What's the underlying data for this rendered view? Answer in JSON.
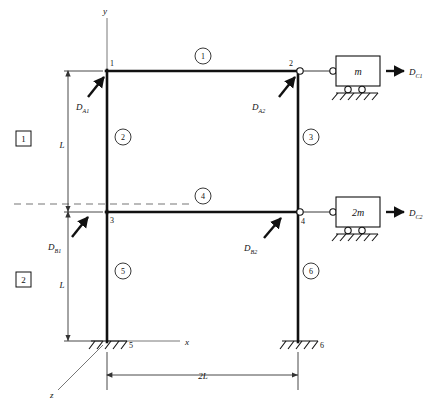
{
  "figure": {
    "axes": {
      "y_label": "y",
      "x_label": "x",
      "z_label": "z"
    },
    "nodes": [
      {
        "id": "1",
        "label": "1",
        "x": 107,
        "y": 71
      },
      {
        "id": "2",
        "label": "2",
        "x": 298,
        "y": 71
      },
      {
        "id": "3",
        "label": "3",
        "x": 107,
        "y": 212
      },
      {
        "id": "4",
        "label": "4",
        "x": 298,
        "y": 212
      },
      {
        "id": "5",
        "label": "5",
        "x": 107,
        "y": 341
      },
      {
        "id": "6",
        "label": "6",
        "x": 298,
        "y": 341
      }
    ],
    "elements": [
      {
        "id": "1",
        "label": "1",
        "cx": 203,
        "cy": 59,
        "type": "beam"
      },
      {
        "id": "2",
        "label": "2",
        "cx": 123,
        "cy": 140,
        "type": "column"
      },
      {
        "id": "3",
        "label": "3",
        "cx": 311,
        "cy": 140,
        "type": "column"
      },
      {
        "id": "4",
        "label": "4",
        "cx": 203,
        "cy": 199,
        "type": "beam"
      },
      {
        "id": "5",
        "label": "5",
        "cx": 123,
        "cy": 274,
        "type": "column"
      },
      {
        "id": "6",
        "label": "6",
        "cx": 311,
        "cy": 274,
        "type": "column"
      }
    ],
    "stories": [
      {
        "label": "1",
        "dimension": "L"
      },
      {
        "label": "2",
        "dimension": "L"
      }
    ],
    "span": {
      "label": "2L"
    },
    "masses": [
      {
        "label": "m",
        "force_base": "D",
        "force_sub": "C1",
        "level": "upper"
      },
      {
        "label": "2m",
        "force_base": "D",
        "force_sub": "C2",
        "level": "lower"
      }
    ],
    "applied_forces": [
      {
        "base": "D",
        "sub": "A1",
        "node": "1",
        "lx": 78,
        "ly": 108
      },
      {
        "base": "D",
        "sub": "A2",
        "node": "2",
        "lx": 254,
        "ly": 108
      },
      {
        "base": "D",
        "sub": "B1",
        "node": "3",
        "lx": 47,
        "ly": 242
      },
      {
        "base": "D",
        "sub": "B2",
        "node": "4",
        "lx": 246,
        "ly": 243
      }
    ],
    "supports": [
      {
        "node": "5",
        "type": "fixed"
      },
      {
        "node": "6",
        "type": "fixed"
      },
      {
        "node": "m-block",
        "type": "roller"
      },
      {
        "node": "2m-block",
        "type": "roller"
      }
    ],
    "colors": {
      "ink": "#111111",
      "dashed": "#777777",
      "paper": "#ffffff"
    }
  }
}
